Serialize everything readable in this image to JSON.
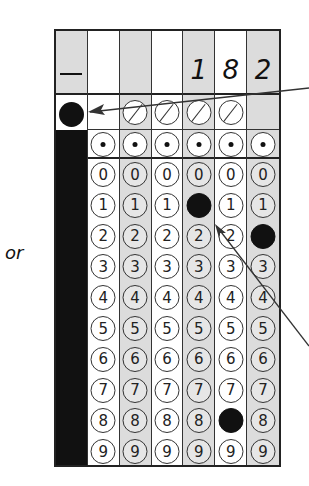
{
  "side_label": "or",
  "grid": {
    "columns": 7,
    "header_values": [
      "—",
      "",
      "",
      "",
      "1",
      "8",
      "2"
    ],
    "column_shading": [
      true,
      false,
      true,
      false,
      true,
      false,
      true
    ],
    "negative_column": {
      "symbol": "—",
      "bubble_filled": true
    },
    "slash_row": [
      false,
      false,
      true,
      true,
      true,
      true,
      false
    ],
    "decimal_row": [
      false,
      true,
      true,
      true,
      true,
      true,
      true
    ],
    "digits": [
      "0",
      "1",
      "2",
      "3",
      "4",
      "5",
      "6",
      "7",
      "8",
      "9"
    ],
    "filled": {
      "4": "1",
      "5": "8",
      "6": "2"
    }
  },
  "annotations": {
    "arrow_to_negative_bubble": true,
    "arrow_to_filled_digit": true
  },
  "colors": {
    "ink": "#111111",
    "shaded_column": "#dcdcdc",
    "border": "#222222"
  }
}
